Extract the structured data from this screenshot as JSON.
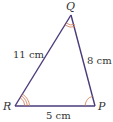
{
  "diagram": {
    "type": "triangle",
    "colors": {
      "edge": "#4a3a7a",
      "angle_mark": "#d07850",
      "text": "#333333"
    },
    "vertices": {
      "Q": {
        "label": "Q",
        "x": 71,
        "y": 15
      },
      "R": {
        "label": "R",
        "x": 15,
        "y": 106
      },
      "P": {
        "label": "P",
        "x": 95,
        "y": 106
      }
    },
    "sides": {
      "QR": {
        "label": "11 cm"
      },
      "QP": {
        "label": "8 cm"
      },
      "RP": {
        "label": "5 cm"
      }
    },
    "angle_marks": {
      "Q": "double-arc",
      "R": "triple-arc",
      "P": "single-arc"
    }
  }
}
